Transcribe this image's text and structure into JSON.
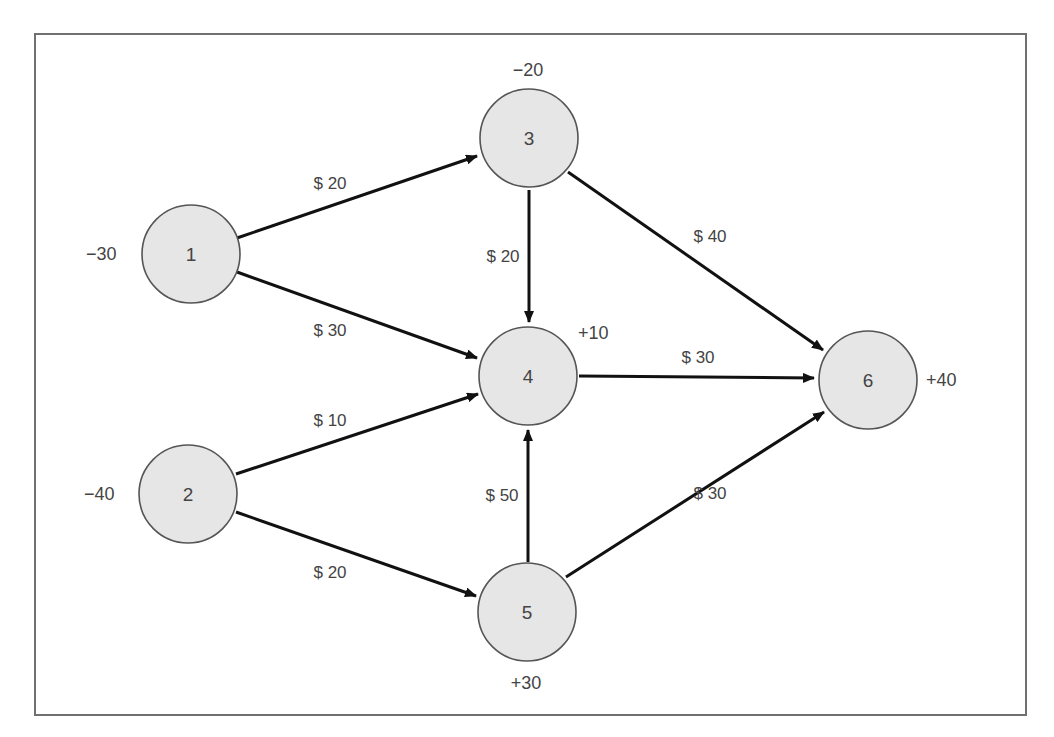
{
  "diagram": {
    "type": "network-flow",
    "nodes": [
      {
        "id": "1",
        "label": "1",
        "supply": "−30",
        "cx": 191,
        "cy": 254,
        "sx": 86,
        "sy": 254,
        "sanchor": "start"
      },
      {
        "id": "2",
        "label": "2",
        "supply": "−40",
        "cx": 188,
        "cy": 494,
        "sx": 84,
        "sy": 494,
        "sanchor": "start"
      },
      {
        "id": "3",
        "label": "3",
        "supply": "−20",
        "cx": 529,
        "cy": 138,
        "sx": 528,
        "sy": 70,
        "sanchor": "middle"
      },
      {
        "id": "4",
        "label": "4",
        "supply": "+10",
        "cx": 528,
        "cy": 376,
        "sx": 578,
        "sy": 333,
        "sanchor": "start"
      },
      {
        "id": "5",
        "label": "5",
        "supply": "+30",
        "cx": 527,
        "cy": 612,
        "sx": 526,
        "sy": 683,
        "sanchor": "middle"
      },
      {
        "id": "6",
        "label": "6",
        "supply": "+40",
        "cx": 868,
        "cy": 380,
        "sx": 926,
        "sy": 380,
        "sanchor": "start"
      }
    ],
    "edges": [
      {
        "from": "1",
        "to": "3",
        "cost": "$ 20",
        "lx": 330,
        "ly": 183,
        "x1": 237,
        "y1": 238,
        "x2": 477,
        "y2": 156
      },
      {
        "from": "1",
        "to": "4",
        "cost": "$ 30",
        "lx": 330,
        "ly": 330,
        "x1": 237,
        "y1": 272,
        "x2": 477,
        "y2": 358
      },
      {
        "from": "3",
        "to": "4",
        "cost": "$ 20",
        "lx": 503,
        "ly": 256,
        "x1": 529,
        "y1": 190,
        "x2": 529,
        "y2": 322
      },
      {
        "from": "3",
        "to": "6",
        "cost": "$ 40",
        "lx": 710,
        "ly": 236,
        "x1": 568,
        "y1": 172,
        "x2": 823,
        "y2": 350
      },
      {
        "from": "4",
        "to": "6",
        "cost": "$ 30",
        "lx": 698,
        "ly": 357,
        "x1": 579,
        "y1": 376,
        "x2": 814,
        "y2": 378
      },
      {
        "from": "2",
        "to": "4",
        "cost": "$ 10",
        "lx": 330,
        "ly": 420,
        "x1": 236,
        "y1": 474,
        "x2": 478,
        "y2": 394
      },
      {
        "from": "2",
        "to": "5",
        "cost": "$ 20",
        "lx": 330,
        "ly": 572,
        "x1": 236,
        "y1": 512,
        "x2": 476,
        "y2": 596
      },
      {
        "from": "5",
        "to": "4",
        "cost": "$ 50",
        "lx": 502,
        "ly": 495,
        "x1": 528,
        "y1": 562,
        "x2": 528,
        "y2": 430
      },
      {
        "from": "5",
        "to": "6",
        "cost": "$ 30",
        "lx": 710,
        "ly": 493,
        "x1": 566,
        "y1": 577,
        "x2": 824,
        "y2": 412
      }
    ]
  }
}
